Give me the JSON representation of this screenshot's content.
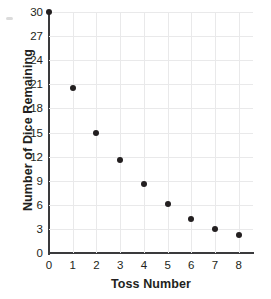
{
  "chart_data": {
    "type": "scatter",
    "title": "",
    "xlabel": "Toss Number",
    "ylabel": "Number of Dice Remaining",
    "xlim": [
      0,
      8.6
    ],
    "ylim": [
      0,
      30
    ],
    "grid": true,
    "legend": null,
    "x_ticks": [
      "0",
      "1",
      "2",
      "3",
      "4",
      "5",
      "6",
      "7",
      "8"
    ],
    "y_ticks": [
      "0",
      "3",
      "6",
      "9",
      "12",
      "15",
      "18",
      "21",
      "24",
      "27",
      "30"
    ],
    "marker_color": "#231f20",
    "grid_color": "#e9e9ea",
    "axis_color": "#3a3a3c",
    "x": [
      0,
      1,
      2,
      3,
      4,
      5,
      6,
      7,
      8
    ],
    "values": [
      30,
      20.5,
      15,
      11.6,
      8.6,
      6.1,
      4.2,
      3,
      2.3
    ],
    "points": [
      {
        "x": 0,
        "y": 30
      },
      {
        "x": 1,
        "y": 20.5
      },
      {
        "x": 2,
        "y": 15
      },
      {
        "x": 3,
        "y": 11.6
      },
      {
        "x": 4,
        "y": 8.6
      },
      {
        "x": 5,
        "y": 6.1
      },
      {
        "x": 6,
        "y": 4.2
      },
      {
        "x": 7,
        "y": 3
      },
      {
        "x": 8,
        "y": 2.3
      }
    ]
  }
}
